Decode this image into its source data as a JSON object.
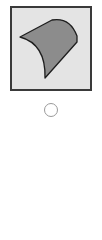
{
  "option": {
    "image": {
      "icon": "curved-cylinder-shape-icon",
      "frame_background": "#e4e4e4",
      "frame_border": "#3a3a3a",
      "shape_fill": "#8c8c8c",
      "shape_stroke": "#1e1e1e"
    },
    "radio": {
      "selected": false,
      "border_color": "#9a9a9a"
    }
  }
}
